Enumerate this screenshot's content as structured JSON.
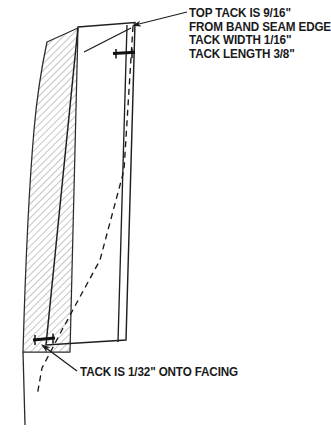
{
  "figure": {
    "background": "#ffffff",
    "ink": "#1a1a1a",
    "hatch_color": "#8a8a8a"
  },
  "annotations": {
    "top_note": {
      "lines": [
        "TOP TACK IS 9/16\"",
        "FROM BAND SEAM EDGE",
        "TACK WIDTH 1/16\"",
        "TACK LENGTH 3/8\""
      ]
    },
    "bottom_note": {
      "text": "TACK IS 1/32\" ONTO FACING"
    }
  },
  "parts": {
    "band": {
      "name": "hatched-band",
      "pattern": "diagonal-hatch"
    },
    "facing": {
      "name": "facing-panel"
    },
    "foldline": {
      "name": "dashed-fold-line",
      "style": "dashed"
    },
    "top_tack": {
      "name": "top-tack-mark"
    },
    "bottom_tack": {
      "name": "bottom-tack-mark"
    }
  },
  "icons": {
    "leader_arrow": "arrow-icon"
  }
}
